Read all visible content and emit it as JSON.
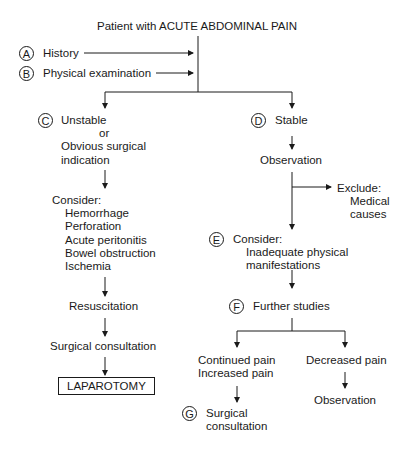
{
  "title": "Patient with ACUTE ABDOMINAL PAIN",
  "inputs": [
    {
      "letter": "A",
      "label": "History"
    },
    {
      "letter": "B",
      "label": "Physical examination"
    }
  ],
  "left_branch": {
    "letter": "C",
    "label_line1": "Unstable",
    "label_line2": "or",
    "label_line3": "Obvious surgical",
    "label_line4": "indication",
    "consider_title": "Consider:",
    "consider_items": [
      "Hemorrhage",
      "Perforation",
      "Acute peritonitis",
      "Bowel obstruction",
      "Ischemia"
    ],
    "step1": "Resuscitation",
    "step2": "Surgical consultation",
    "final": "LAPAROTOMY"
  },
  "right_branch": {
    "letter": "D",
    "label": "Stable",
    "observation": "Observation",
    "exclude_title": "Exclude:",
    "exclude_line1": "Medical",
    "exclude_line2": "causes",
    "consider_letter": "E",
    "consider_title": "Consider:",
    "consider_line1": "Inadequate physical",
    "consider_line2": "manifestations",
    "further_letter": "F",
    "further": "Further studies",
    "sub_left_line1": "Continued pain",
    "sub_left_line2": "Increased pain",
    "sub_left_letter": "G",
    "sub_left_result_line1": "Surgical",
    "sub_left_result_line2": "consultation",
    "sub_right": "Decreased pain",
    "sub_right_result": "Observation"
  }
}
